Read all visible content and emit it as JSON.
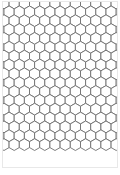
{
  "page": {
    "background_color": "#ffffff",
    "width_px": 120,
    "height_px": 175
  },
  "sheet": {
    "label": "Pattern sheet",
    "border_color": "#e8e8e8",
    "fill_color": "#ffffff",
    "left_px": 2,
    "top_px": 1,
    "width_px": 116,
    "height_px": 167
  },
  "pattern": {
    "name": "hexagonal-tessellation",
    "description": "Honeycomb grid of pointy-top hexagons tiling the sheet",
    "orientation": "pointy-top",
    "columns": 12,
    "rows": 15,
    "hex_width_px": 10.2,
    "hex_height_px": 11.8,
    "row_pitch_px": 8.85,
    "column_pitch_px": 10.2,
    "outline_color": "#6f6f6f",
    "fill_color": "#ffffff",
    "stroke_width_px": 0.9
  },
  "margins": {
    "bottom_label": "bottom margin",
    "bottom_height_px": 7,
    "color": "#ffffff"
  }
}
